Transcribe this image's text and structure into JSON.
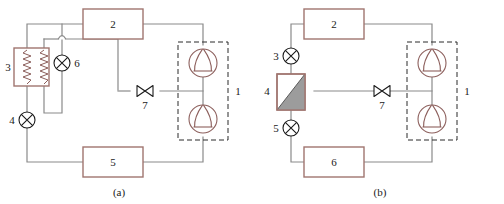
{
  "figure": {
    "type": "schematic-diagram",
    "colors": {
      "pipe": "#8a8a8a",
      "component_outline": "#a0756f",
      "symbol_outline": "#8c5f5c",
      "black_symbol": "#1a1a1a",
      "gray_fill": "#9c9c9c",
      "dashed_box": "#2b2b2b",
      "background": "#ffffff"
    }
  },
  "panels": [
    {
      "id": "a",
      "caption": "(a)",
      "components": [
        {
          "ref": "1",
          "label": "1",
          "kind": "compressor-group",
          "note": "two compressors in dashed enclosure"
        },
        {
          "ref": "2",
          "label": "2",
          "kind": "rectangle-box"
        },
        {
          "ref": "3",
          "label": "3",
          "kind": "heat-exchanger-coil"
        },
        {
          "ref": "4",
          "label": "4",
          "kind": "crossed-circle-valve"
        },
        {
          "ref": "5",
          "label": "5",
          "kind": "rectangle-box"
        },
        {
          "ref": "6",
          "label": "6",
          "kind": "crossed-circle-valve"
        },
        {
          "ref": "7",
          "label": "7",
          "kind": "bowtie-valve"
        }
      ]
    },
    {
      "id": "b",
      "caption": "(b)",
      "components": [
        {
          "ref": "1",
          "label": "1",
          "kind": "compressor-group",
          "note": "two compressors in dashed enclosure"
        },
        {
          "ref": "2",
          "label": "2",
          "kind": "rectangle-box"
        },
        {
          "ref": "3",
          "label": "3",
          "kind": "crossed-circle-valve"
        },
        {
          "ref": "4",
          "label": "4",
          "kind": "half-shaded-rectangle"
        },
        {
          "ref": "5",
          "label": "5",
          "kind": "crossed-circle-valve"
        },
        {
          "ref": "6",
          "label": "6",
          "kind": "rectangle-box"
        },
        {
          "ref": "7",
          "label": "7",
          "kind": "bowtie-valve"
        }
      ]
    }
  ]
}
